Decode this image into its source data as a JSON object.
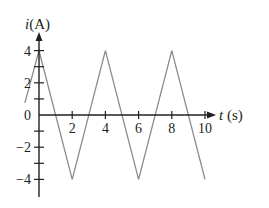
{
  "chart_data": {
    "type": "line",
    "title": "",
    "xlabel": "t (s)",
    "ylabel": "i(A)",
    "xlabel_var": "t",
    "xlabel_unit": " (s)",
    "ylabel_var": "i",
    "ylabel_unit": "(A)",
    "x_ticks": [
      2,
      4,
      6,
      8,
      10
    ],
    "x_tick_labels": [
      "2",
      "4",
      "6",
      "8",
      "10"
    ],
    "y_ticks": [
      -4,
      -3,
      -2,
      -1,
      1,
      2,
      3,
      4
    ],
    "y_tick_labels": [
      {
        "value": 4,
        "label": "4"
      },
      {
        "value": 2,
        "label": "2"
      },
      {
        "value": 0,
        "label": "0"
      },
      {
        "value": -2,
        "label": "−2"
      },
      {
        "value": -4,
        "label": "−4"
      }
    ],
    "xlim": [
      -1,
      12
    ],
    "ylim": [
      -5,
      5
    ],
    "grid": false,
    "legend": null,
    "series": [
      {
        "name": "i(t)",
        "color": "#8a8a8a",
        "x": [
          -0.85,
          0,
          2,
          4,
          6,
          8,
          10
        ],
        "y": [
          0.75,
          4,
          -4,
          4,
          -4,
          4,
          -4
        ]
      }
    ]
  },
  "colors": {
    "axis": "#231f20",
    "waveform": "#8a8a8a",
    "background": "#ffffff"
  }
}
